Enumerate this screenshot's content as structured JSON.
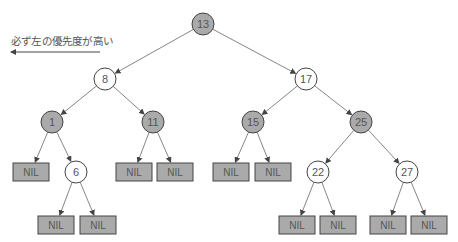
{
  "caption": "必ず左の優先度が高い",
  "colors": {
    "black_node_fill": "#aaaaaa",
    "red_node_fill": "#ffffff",
    "nil_fill": "#aaaaaa",
    "stroke": "#444444",
    "edge": "#777777",
    "text": "#555555"
  },
  "nodes": [
    {
      "id": "n13",
      "label": "13",
      "x": 203,
      "y": 24,
      "color": "black"
    },
    {
      "id": "n8",
      "label": "8",
      "x": 105,
      "y": 79,
      "color": "red"
    },
    {
      "id": "n17",
      "label": "17",
      "x": 306,
      "y": 79,
      "color": "red"
    },
    {
      "id": "n1",
      "label": "1",
      "x": 52,
      "y": 122,
      "color": "black"
    },
    {
      "id": "n11",
      "label": "11",
      "x": 153,
      "y": 122,
      "color": "black"
    },
    {
      "id": "n15",
      "label": "15",
      "x": 253,
      "y": 122,
      "color": "black"
    },
    {
      "id": "n25",
      "label": "25",
      "x": 361,
      "y": 122,
      "color": "black"
    },
    {
      "id": "n6",
      "label": "6",
      "x": 76,
      "y": 172,
      "color": "red"
    },
    {
      "id": "n22",
      "label": "22",
      "x": 318,
      "y": 172,
      "color": "red"
    },
    {
      "id": "n27",
      "label": "27",
      "x": 407,
      "y": 172,
      "color": "red"
    }
  ],
  "nils": [
    {
      "id": "nil1",
      "label": "NIL",
      "x": 13,
      "y": 163,
      "parent": "n1"
    },
    {
      "id": "nil2",
      "label": "NIL",
      "x": 116,
      "y": 163,
      "parent": "n11"
    },
    {
      "id": "nil3",
      "label": "NIL",
      "x": 157,
      "y": 163,
      "parent": "n11"
    },
    {
      "id": "nil4",
      "label": "NIL",
      "x": 213,
      "y": 163,
      "parent": "n15"
    },
    {
      "id": "nil5",
      "label": "NIL",
      "x": 255,
      "y": 163,
      "parent": "n15"
    },
    {
      "id": "nil6",
      "label": "NIL",
      "x": 38,
      "y": 216,
      "parent": "n6"
    },
    {
      "id": "nil7",
      "label": "NIL",
      "x": 80,
      "y": 216,
      "parent": "n6"
    },
    {
      "id": "nil8",
      "label": "NIL",
      "x": 279,
      "y": 216,
      "parent": "n22"
    },
    {
      "id": "nil9",
      "label": "NIL",
      "x": 320,
      "y": 216,
      "parent": "n22"
    },
    {
      "id": "nil10",
      "label": "NIL",
      "x": 370,
      "y": 216,
      "parent": "n27"
    },
    {
      "id": "nil11",
      "label": "NIL",
      "x": 411,
      "y": 216,
      "parent": "n27"
    }
  ],
  "edges": [
    [
      "n13",
      "n8"
    ],
    [
      "n13",
      "n17"
    ],
    [
      "n8",
      "n1"
    ],
    [
      "n8",
      "n11"
    ],
    [
      "n17",
      "n15"
    ],
    [
      "n17",
      "n25"
    ],
    [
      "n1",
      "nil1"
    ],
    [
      "n1",
      "n6"
    ],
    [
      "n11",
      "nil2"
    ],
    [
      "n11",
      "nil3"
    ],
    [
      "n15",
      "nil4"
    ],
    [
      "n15",
      "nil5"
    ],
    [
      "n25",
      "n22"
    ],
    [
      "n25",
      "n27"
    ],
    [
      "n6",
      "nil6"
    ],
    [
      "n6",
      "nil7"
    ],
    [
      "n22",
      "nil8"
    ],
    [
      "n22",
      "nil9"
    ],
    [
      "n27",
      "nil10"
    ],
    [
      "n27",
      "nil11"
    ]
  ],
  "priority_arrow": {
    "x1": 100,
    "y1": 52,
    "x2": 11,
    "y2": 52
  }
}
